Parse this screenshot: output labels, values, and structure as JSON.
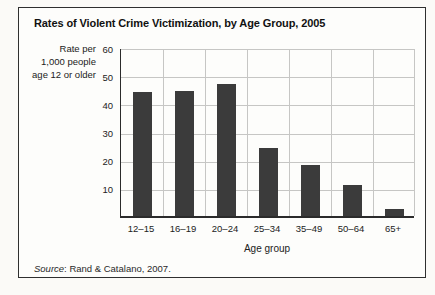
{
  "figure": {
    "title": "Rates of Violent Crime Victimization, by Age Group, 2005",
    "y_axis_unit_lines": [
      "Rate per",
      "1,000 people",
      "age 12 or older"
    ],
    "source_label": "Source",
    "source_text": ": Rand & Catalano, 2007."
  },
  "chart_data": {
    "type": "bar",
    "title": "Rates of Violent Crime Victimization, by Age Group, 2005",
    "categories": [
      "12–15",
      "16–19",
      "20–24",
      "25–34",
      "35–49",
      "50–64",
      "65+"
    ],
    "values": [
      44,
      44.5,
      47,
      24,
      18,
      11,
      2.5
    ],
    "xlabel": "Age group",
    "ylabel": "Rate per 1,000 people age 12 or older",
    "ylim": [
      0,
      60
    ],
    "yticks": [
      60,
      50,
      40,
      30,
      20,
      10
    ],
    "grid": true,
    "legend": "none",
    "bar_color": "#3b3b3b",
    "source": "Source: Rand & Catalano, 2007."
  }
}
